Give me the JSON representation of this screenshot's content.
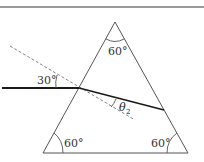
{
  "diagram": {
    "prism": {
      "apex_angle": "60°",
      "bottom_left_angle": "60°",
      "bottom_right_angle": "60°"
    },
    "incident_angle_label": "30°",
    "refraction_angle_label": {
      "symbol": "θ",
      "subscript": "2"
    },
    "colors": {
      "prism_edge": "#555555",
      "ray": "#1a1a1a",
      "normal_dashed": "#777777",
      "top_rule": "#9a9a9a"
    }
  }
}
